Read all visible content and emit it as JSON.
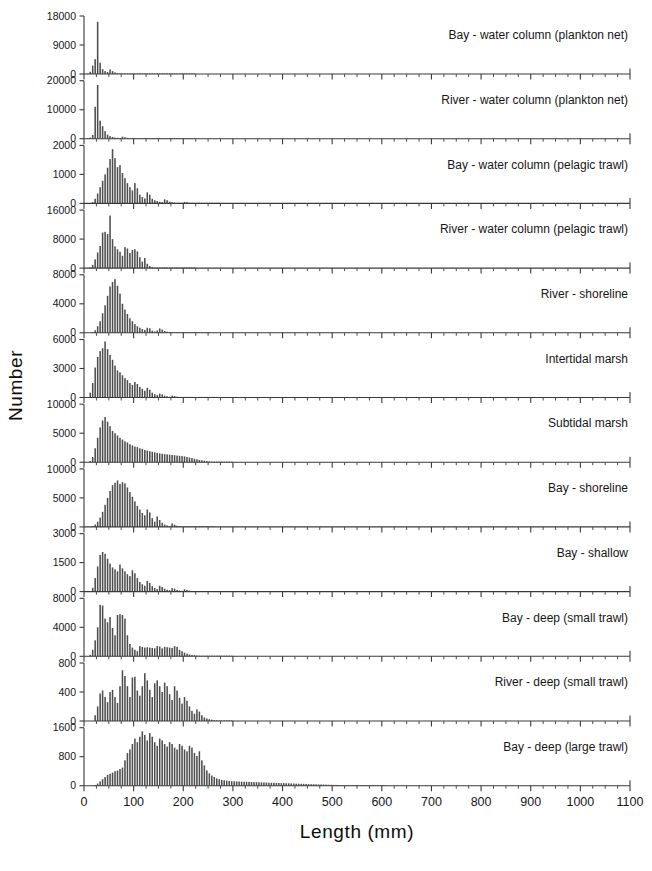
{
  "figure": {
    "axis_titles": {
      "x": "Length (mm)",
      "y": "Number"
    },
    "bar_color": "#4d4d4d",
    "axis_color": "#3a3a3a",
    "background": "#ffffff"
  },
  "chart_data": {
    "type": "bar",
    "title": "",
    "xlabel": "Length (mm)",
    "ylabel": "Number",
    "xlim": [
      0,
      1100
    ],
    "xticks": [
      0,
      100,
      200,
      300,
      400,
      500,
      600,
      700,
      800,
      900,
      1000,
      1100
    ],
    "xtick_labels": [
      "0",
      "100",
      "200",
      "300",
      "400",
      "500",
      "600",
      "700",
      "800",
      "900",
      "1000",
      "1100"
    ],
    "minor_tick_interval": 25,
    "grid": false,
    "legend": "none",
    "bin_width": 5,
    "shared_x_axis": true,
    "panels": [
      {
        "label": "Bay - water column (plankton net)",
        "ylim": [
          0,
          18000
        ],
        "yticks": [
          0,
          9000,
          18000
        ],
        "ytick_labels": [
          "0",
          "9000",
          "18000"
        ],
        "bins_start": 0,
        "values": [
          0,
          120,
          700,
          2600,
          4600,
          16200,
          3500,
          1500,
          900,
          600,
          1400,
          900,
          500,
          280,
          180,
          140,
          110,
          90,
          60,
          40,
          30,
          25,
          20,
          60,
          90,
          40,
          20,
          10,
          8,
          6,
          5,
          4,
          3,
          30,
          40,
          20,
          5,
          3,
          2,
          2,
          1,
          1,
          1,
          1,
          1,
          0,
          0,
          0,
          0,
          0,
          0,
          0,
          0,
          0,
          0,
          0,
          0,
          0,
          0,
          0
        ]
      },
      {
        "label": "River - water column (plankton net)",
        "ylim": [
          0,
          20000
        ],
        "yticks": [
          0,
          10000,
          20000
        ],
        "ytick_labels": [
          "0",
          "10000",
          "20000"
        ],
        "bins_start": 0,
        "values": [
          0,
          80,
          400,
          1300,
          11000,
          18500,
          6200,
          4300,
          2600,
          1400,
          900,
          600,
          400,
          300,
          220,
          700,
          500,
          300,
          200,
          140,
          100,
          80,
          60,
          45,
          35,
          28,
          22,
          18,
          14,
          11,
          9,
          7,
          6,
          5,
          4,
          3,
          3,
          2,
          2,
          2,
          1,
          1,
          1,
          1,
          1,
          0,
          0,
          0,
          0,
          0,
          0,
          0,
          0,
          0,
          0,
          0,
          0,
          0,
          0,
          0
        ]
      },
      {
        "label": "Bay - water column (pelagic trawl)",
        "ylim": [
          0,
          2000
        ],
        "yticks": [
          0,
          1000,
          2000
        ],
        "ytick_labels": [
          "0",
          "1000",
          "2000"
        ],
        "bins_start": 0,
        "values": [
          0,
          0,
          0,
          40,
          160,
          340,
          560,
          780,
          1000,
          1230,
          1530,
          1870,
          1560,
          1250,
          1320,
          1050,
          870,
          700,
          560,
          450,
          700,
          520,
          300,
          220,
          170,
          380,
          300,
          160,
          110,
          80,
          60,
          45,
          140,
          110,
          60,
          40,
          30,
          20,
          15,
          12,
          50,
          40,
          20,
          12,
          8,
          6,
          5,
          4,
          3,
          2,
          2,
          1,
          1,
          1,
          1,
          0,
          0,
          0,
          0,
          0
        ]
      },
      {
        "label": "River - water column (pelagic trawl)",
        "ylim": [
          0,
          16000
        ],
        "yticks": [
          0,
          8000,
          16000
        ],
        "ytick_labels": [
          "0",
          "8000",
          "16000"
        ],
        "bins_start": 0,
        "values": [
          0,
          0,
          200,
          900,
          2400,
          4300,
          6100,
          9800,
          10000,
          9400,
          14500,
          8000,
          6000,
          5200,
          4500,
          3400,
          5800,
          5400,
          4200,
          5000,
          5200,
          4600,
          3000,
          1800,
          2800,
          1200,
          600,
          300,
          140,
          70,
          40,
          25,
          18,
          12,
          9,
          7,
          5,
          4,
          3,
          2,
          2,
          1,
          1,
          1,
          1,
          0,
          0,
          0,
          0,
          0,
          0,
          0,
          0,
          0,
          0,
          0,
          0,
          0,
          0,
          0
        ]
      },
      {
        "label": "River - shoreline",
        "ylim": [
          0,
          8000
        ],
        "yticks": [
          0,
          4000,
          8000
        ],
        "ytick_labels": [
          "0",
          "4000",
          "8000"
        ],
        "bins_start": 0,
        "values": [
          0,
          0,
          0,
          100,
          350,
          900,
          1600,
          2700,
          3800,
          5100,
          6400,
          7000,
          7400,
          6500,
          5400,
          4000,
          3200,
          2600,
          2000,
          1600,
          1200,
          900,
          700,
          520,
          400,
          700,
          620,
          300,
          180,
          320,
          600,
          450,
          250,
          150,
          90,
          60,
          40,
          28,
          20,
          14,
          10,
          8,
          6,
          4,
          3,
          2,
          2,
          1,
          1,
          1,
          1,
          0,
          0,
          0,
          0,
          0,
          0,
          0,
          0,
          0
        ]
      },
      {
        "label": "Intertidal marsh",
        "ylim": [
          0,
          6000
        ],
        "yticks": [
          0,
          3000,
          6000
        ],
        "ytick_labels": [
          "0",
          "3000",
          "6000"
        ],
        "bins_start": 0,
        "values": [
          0,
          0,
          500,
          1500,
          3100,
          4200,
          4800,
          5100,
          5800,
          5000,
          4400,
          3900,
          3300,
          2800,
          2600,
          2300,
          2000,
          1800,
          1500,
          1300,
          1600,
          1400,
          1100,
          900,
          700,
          1000,
          800,
          500,
          340,
          240,
          400,
          320,
          200,
          130,
          90,
          200,
          160,
          90,
          60,
          40,
          28,
          20,
          14,
          10,
          8,
          6,
          4,
          3,
          2,
          2,
          1,
          1,
          1,
          1,
          0,
          0,
          0,
          0,
          0,
          0
        ]
      },
      {
        "label": "Subtidal marsh",
        "ylim": [
          0,
          10000
        ],
        "yticks": [
          0,
          5000,
          10000
        ],
        "ytick_labels": [
          "0",
          "5000",
          "10000"
        ],
        "bins_start": 0,
        "values": [
          0,
          0,
          200,
          900,
          2400,
          4200,
          6000,
          7200,
          7800,
          7000,
          6200,
          5400,
          5000,
          4600,
          4200,
          3900,
          3600,
          3400,
          3100,
          2900,
          2700,
          2600,
          2400,
          2300,
          2100,
          2000,
          1900,
          1800,
          1700,
          1600,
          1500,
          1450,
          1400,
          1350,
          1300,
          1250,
          1200,
          1150,
          1100,
          1050,
          1000,
          900,
          800,
          700,
          600,
          500,
          400,
          320,
          250,
          190,
          140,
          100,
          70,
          50,
          35,
          25,
          18,
          12,
          8,
          5
        ]
      },
      {
        "label": "Bay - shoreline",
        "ylim": [
          0,
          10000
        ],
        "yticks": [
          0,
          5000,
          10000
        ],
        "ytick_labels": [
          "0",
          "5000",
          "10000"
        ],
        "bins_start": 0,
        "values": [
          0,
          0,
          0,
          100,
          400,
          900,
          1600,
          2600,
          3800,
          5000,
          6200,
          7200,
          7600,
          8000,
          7400,
          7700,
          7500,
          6800,
          6000,
          5200,
          4400,
          3600,
          3000,
          2400,
          2000,
          3000,
          2500,
          1500,
          900,
          1800,
          1200,
          700,
          400,
          250,
          160,
          600,
          400,
          200,
          120,
          70,
          45,
          30,
          20,
          14,
          10,
          7,
          5,
          3,
          2,
          2,
          1,
          1,
          1,
          0,
          0,
          0,
          0,
          0,
          0,
          0
        ]
      },
      {
        "label": "Bay - shallow",
        "ylim": [
          0,
          3000
        ],
        "yticks": [
          0,
          1500,
          3000
        ],
        "ytick_labels": [
          "0",
          "1500",
          "3000"
        ],
        "bins_start": 0,
        "values": [
          0,
          0,
          0,
          200,
          700,
          1300,
          1900,
          2050,
          1950,
          1700,
          1450,
          1250,
          1150,
          1050,
          1400,
          1200,
          1050,
          900,
          800,
          1100,
          950,
          700,
          500,
          380,
          300,
          550,
          450,
          280,
          190,
          130,
          300,
          240,
          150,
          100,
          70,
          180,
          150,
          90,
          60,
          40,
          120,
          90,
          50,
          30,
          20,
          14,
          10,
          7,
          5,
          3,
          2,
          2,
          1,
          1,
          1,
          0,
          0,
          0,
          0,
          0
        ]
      },
      {
        "label": "Bay - deep (small trawl)",
        "ylim": [
          0,
          8000
        ],
        "yticks": [
          0,
          4000,
          8000
        ],
        "ytick_labels": [
          "0",
          "4000",
          "8000"
        ],
        "bins_start": 0,
        "values": [
          0,
          0,
          200,
          900,
          2200,
          4000,
          7100,
          7000,
          5200,
          4700,
          5400,
          3900,
          2900,
          5700,
          5800,
          5700,
          5200,
          2900,
          1700,
          1200,
          900,
          700,
          1400,
          1300,
          1200,
          1250,
          1200,
          1150,
          1100,
          1400,
          1350,
          1100,
          1300,
          1250,
          1200,
          1150,
          1400,
          1300,
          900,
          700,
          500,
          350,
          250,
          180,
          140,
          110,
          90,
          70,
          55,
          45,
          35,
          28,
          22,
          18,
          14,
          11,
          9,
          7,
          5,
          4
        ]
      },
      {
        "label": "River - deep (small trawl)",
        "ylim": [
          0,
          800
        ],
        "yticks": [
          0,
          400,
          800
        ],
        "ytick_labels": [
          "0",
          "400",
          "800"
        ],
        "bins_start": 0,
        "values": [
          0,
          0,
          0,
          0,
          80,
          200,
          380,
          420,
          330,
          260,
          400,
          430,
          330,
          250,
          480,
          700,
          620,
          480,
          330,
          600,
          610,
          420,
          350,
          480,
          660,
          560,
          430,
          330,
          520,
          560,
          480,
          400,
          530,
          480,
          370,
          290,
          480,
          420,
          320,
          240,
          330,
          280,
          200,
          140,
          100,
          160,
          130,
          80,
          50,
          35,
          25,
          18,
          12,
          8,
          5,
          3,
          2,
          2,
          1,
          1
        ]
      },
      {
        "label": "Bay - deep (large trawl)",
        "ylim": [
          0,
          1600
        ],
        "yticks": [
          0,
          800,
          1600
        ],
        "ytick_labels": [
          "0",
          "800",
          "1600"
        ],
        "bins_start": 0,
        "values": [
          0,
          0,
          0,
          0,
          20,
          60,
          120,
          180,
          240,
          300,
          330,
          360,
          400,
          420,
          460,
          500,
          700,
          900,
          1000,
          1150,
          1300,
          1200,
          1350,
          1500,
          1400,
          1250,
          1450,
          1350,
          1200,
          1100,
          1300,
          1250,
          1150,
          1080,
          1200,
          1150,
          1050,
          1000,
          1150,
          1100,
          1000,
          950,
          1100,
          1050,
          900,
          820,
          950,
          700,
          560,
          420,
          340,
          280,
          240,
          200,
          180,
          160,
          150,
          140,
          130,
          125,
          120,
          118,
          115,
          112,
          110,
          108,
          105,
          102,
          100,
          98,
          95,
          92,
          90,
          88,
          85,
          82,
          80,
          78,
          75,
          72,
          70,
          68,
          65,
          62,
          60,
          58,
          55,
          52,
          50,
          48,
          45,
          42,
          40,
          38,
          36,
          34,
          32,
          30,
          28,
          26,
          24,
          22,
          20,
          18,
          16,
          15,
          14,
          12,
          11,
          10,
          9,
          8,
          7,
          6,
          5,
          4,
          3,
          2,
          2,
          1,
          1,
          1,
          0,
          0,
          0,
          0,
          0,
          0,
          0,
          0,
          0,
          0,
          0,
          0,
          0,
          0,
          0,
          0,
          0,
          0,
          0,
          0,
          0,
          0,
          0,
          0,
          0,
          0,
          0,
          0,
          0,
          0,
          0,
          0,
          0,
          0,
          0,
          0,
          0,
          0,
          0,
          0,
          0,
          0,
          0,
          0,
          0,
          0,
          0,
          0,
          0,
          0,
          0,
          0,
          0,
          0,
          0,
          0,
          0,
          0,
          0,
          0,
          0,
          0,
          0,
          0,
          0,
          0,
          0,
          0,
          0,
          0,
          0,
          0,
          0,
          0,
          0,
          0,
          0,
          0,
          0,
          0,
          0,
          0,
          0,
          0,
          0
        ]
      }
    ]
  }
}
